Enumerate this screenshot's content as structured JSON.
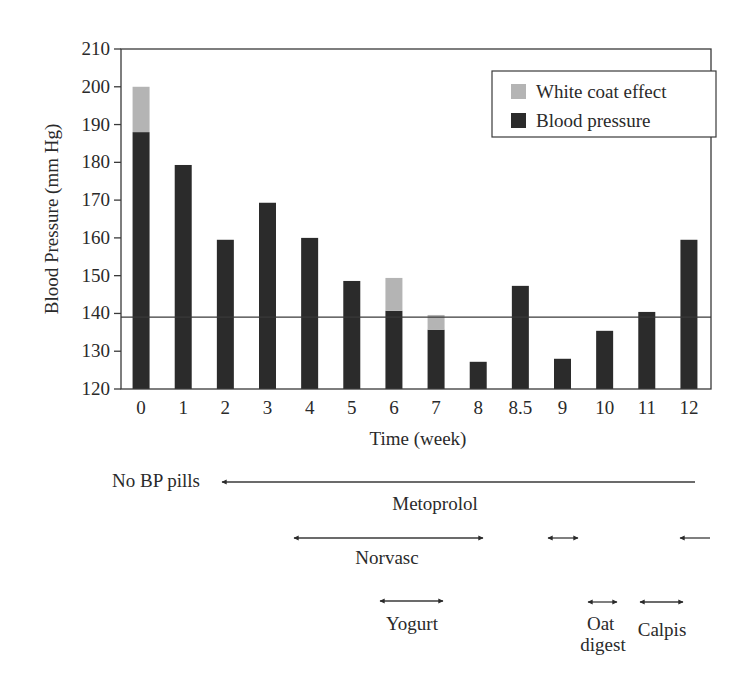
{
  "chart_data": {
    "type": "bar",
    "stacked": true,
    "title": "",
    "xlabel": "Time (week)",
    "ylabel": "Blood Pressure (mm Hg)",
    "ylim": [
      120,
      210
    ],
    "yticks": [
      120,
      130,
      140,
      150,
      160,
      170,
      180,
      190,
      200,
      210
    ],
    "categories": [
      "0",
      "1",
      "2",
      "3",
      "4",
      "5",
      "6",
      "7",
      "8",
      "8.5",
      "9",
      "10",
      "11",
      "12"
    ],
    "series": [
      {
        "name": "Blood pressure",
        "color": "#2b2b2b",
        "values": [
          188,
          179.3,
          159.5,
          169.3,
          160,
          148.6,
          140.7,
          135.7,
          127.2,
          147.3,
          128,
          135.4,
          140.4,
          159.5
        ]
      },
      {
        "name": "White coat effect",
        "color": "#b4b4b4",
        "values": [
          12,
          0,
          0,
          0,
          0,
          0,
          8.7,
          3.9,
          0,
          0,
          0,
          0,
          0,
          0
        ]
      }
    ],
    "reference_line": {
      "value": 139
    },
    "legend": {
      "position": "top-right",
      "entries": [
        "White coat effect",
        "Blood pressure"
      ]
    },
    "grid": false,
    "annotations": [
      {
        "label": "No BP pills",
        "arrow": "left-end",
        "from": "0",
        "to": "12",
        "row": 1,
        "label_position": "left-of-arrow"
      },
      {
        "label": "Metoprolol",
        "row": 1,
        "label_position": "below-center"
      },
      {
        "label": "Norvasc",
        "arrow": "double",
        "from": "4",
        "to": "8",
        "row": 2
      },
      {
        "label": "",
        "arrow": "double",
        "from": "9",
        "to": "9",
        "row": 2
      },
      {
        "label": "",
        "arrow": "left-start",
        "from": "12",
        "to": "12+",
        "row": 2
      },
      {
        "label": "Yogurt",
        "arrow": "double",
        "from": "6",
        "to": "7",
        "row": 3
      },
      {
        "label": "Oat digest",
        "arrow": "double",
        "from": "10",
        "to": "10",
        "row": 3
      },
      {
        "label": "Calpis",
        "arrow": "double",
        "from": "11",
        "to": "11.5",
        "row": 3
      }
    ]
  }
}
